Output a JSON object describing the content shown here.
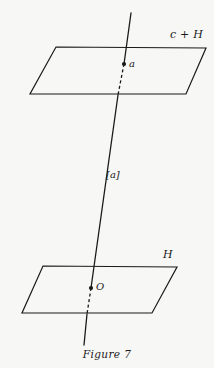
{
  "figure": {
    "caption": "Figure 7",
    "background_color": "#f7f7f5",
    "ink_color": "#1a1a1a",
    "width": 214,
    "height": 368,
    "labels": {
      "plane_top": "c + H",
      "plane_bottom": "H",
      "point_top": "a",
      "point_bottom": "O",
      "coset_segment": "[a]"
    },
    "geometry": {
      "plane_top": {
        "name": "c + H",
        "points": "56,47 206,48 186,94 30,94",
        "stroke_width": 1.2
      },
      "plane_bottom": {
        "name": "H",
        "points": "43,266 177,267 152,313 22,313",
        "stroke_width": 1.2
      },
      "line_solid_upper": {
        "x1": 131,
        "y1": 13,
        "x2": 124,
        "y2": 64
      },
      "line_dashed_upper": {
        "x1": 124,
        "y1": 64,
        "x2": 118,
        "y2": 95
      },
      "line_solid_middle": {
        "x1": 118,
        "y1": 95,
        "x2": 91,
        "y2": 288
      },
      "line_dashed_lower": {
        "x1": 91,
        "y1": 288,
        "x2": 87,
        "y2": 314
      },
      "line_solid_lower": {
        "x1": 87,
        "y1": 314,
        "x2": 84,
        "y2": 345
      },
      "dot_a": {
        "cx": 124,
        "cy": 64,
        "r": 2.1
      },
      "dot_o": {
        "cx": 91,
        "cy": 288,
        "r": 2.1
      },
      "dash_pattern": "3,2.6",
      "line_stroke_width": 1.3
    }
  }
}
